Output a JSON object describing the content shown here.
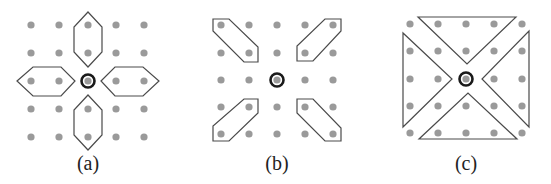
{
  "figure": {
    "panels": [
      {
        "id": "a",
        "label": "(a)",
        "label_pos": [
          88,
          152
        ],
        "grid": {
          "xs": [
            31,
            59,
            88,
            116,
            144
          ],
          "ys": [
            25,
            53,
            81,
            109,
            137
          ]
        },
        "center": [
          88,
          81
        ],
        "shapes": [
          {
            "name": "hexagon-top",
            "points": "88,12 102,27 102,52 88,67 74,52 74,27"
          },
          {
            "name": "hexagon-bottom",
            "points": "88,95 102,110 102,135 88,150 74,135 74,110"
          },
          {
            "name": "hexagon-left",
            "points": "17,81 33,67 61,67 75,81 61,96 33,96"
          },
          {
            "name": "hexagon-right",
            "points": "101,81 115,67 143,67 159,81 143,96 115,96"
          }
        ]
      },
      {
        "id": "b",
        "label": "(b)",
        "label_pos": [
          277,
          152
        ],
        "grid": {
          "xs": [
            221,
            249,
            277,
            305,
            333
          ],
          "ys": [
            25,
            53,
            80,
            107,
            134
          ]
        },
        "center": [
          277,
          80
        ],
        "shapes": [
          {
            "name": "parallelogram-top-left",
            "points": "213,19 229,19 258,47 258,62 244,62 213,31"
          },
          {
            "name": "parallelogram-top-right",
            "points": "325,19 341,19 341,31 313,61 297,61 297,46"
          },
          {
            "name": "parallelogram-bottom-left",
            "points": "213,126 213,141 229,141 258,113 258,99 244,99"
          },
          {
            "name": "parallelogram-bottom-right",
            "points": "297,99 313,99 341,128 341,141 325,141 297,113"
          }
        ]
      },
      {
        "id": "c",
        "label": "(c)",
        "label_pos": [
          466,
          152
        ],
        "grid": {
          "xs": [
            410,
            438,
            466,
            494,
            522
          ],
          "ys": [
            24,
            51,
            79,
            106,
            133
          ]
        },
        "center": [
          466,
          79
        ],
        "shapes": [
          {
            "name": "triangle-top",
            "points": "418,17 516,17 467,64"
          },
          {
            "name": "triangle-left",
            "points": "403,33 403,127 452,79"
          },
          {
            "name": "triangle-right",
            "points": "529,31 529,127 482,79"
          },
          {
            "name": "triangle-bottom",
            "points": "419,139 517,139 468,93"
          }
        ]
      }
    ],
    "colors": {
      "dot": "#9a9a9a",
      "outline": "#4a4a4a",
      "center_ring": "#1a1a1a"
    }
  }
}
